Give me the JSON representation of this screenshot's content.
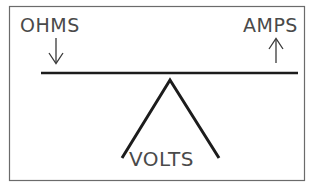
{
  "diagram": {
    "background_color": "#ffffff",
    "frame": {
      "name": "diagram-frame",
      "stroke_color": "#6b6b6b",
      "x": 9,
      "y": 6,
      "width": 296,
      "height": 175
    },
    "beam": {
      "name": "balance-beam",
      "stroke_color": "#1c1c1c",
      "x1": 41,
      "y1": 73,
      "x2": 298,
      "y2": 73
    },
    "fulcrum": {
      "name": "fulcrum-triangle",
      "stroke_color": "#1c1c1c",
      "apex_x": 170,
      "apex_y": 80,
      "left_x": 122,
      "left_y": 158,
      "right_x": 219,
      "right_y": 158
    },
    "labels": {
      "ohms": {
        "text": "OHMS",
        "x": 20,
        "y": 32,
        "color": "#4a4a4a"
      },
      "amps": {
        "text": "AMPS",
        "x": 243,
        "y": 32,
        "color": "#4a4a4a"
      },
      "volts": {
        "text": "VOLTS",
        "x": 129,
        "y": 166,
        "color": "#4a4a4a"
      }
    },
    "arrows": {
      "ohms_arrow": {
        "direction": "down",
        "icon": "arrow-down-icon",
        "color": "#3a3a3a",
        "x": 56,
        "y_start": 38,
        "y_end": 63
      },
      "amps_arrow": {
        "direction": "up",
        "icon": "arrow-up-icon",
        "color": "#3a3a3a",
        "x": 276,
        "y_start": 63,
        "y_end": 39
      }
    }
  }
}
